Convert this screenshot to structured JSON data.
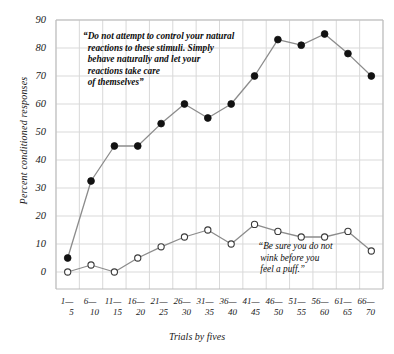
{
  "chart_data": {
    "type": "line",
    "title": "",
    "xlabel": "Trials by fives",
    "ylabel": "Percent conditioned responses",
    "ylim": [
      0,
      90
    ],
    "ytick_step": 10,
    "grid": true,
    "legend_position": "none",
    "categories": [
      "1—\n5",
      "6—\n10",
      "11—\n15",
      "16—\n20",
      "21—\n25",
      "26—\n30",
      "31—\n35",
      "36—\n40",
      "41—\n45",
      "46—\n50",
      "51—\n55",
      "56—\n60",
      "61—\n65",
      "66—\n70"
    ],
    "xtick_tops": [
      "1—",
      "6—",
      "11—",
      "16—",
      "21—",
      "26—",
      "31—",
      "36—",
      "41—",
      "46—",
      "51—",
      "56—",
      "61—",
      "66—"
    ],
    "xtick_bottoms": [
      "5",
      "10",
      "15",
      "20",
      "25",
      "30",
      "35",
      "40",
      "45",
      "50",
      "55",
      "60",
      "65",
      "70"
    ],
    "ytick_labels": [
      "0",
      "10",
      "20",
      "30",
      "40",
      "50",
      "60",
      "70",
      "80",
      "90"
    ],
    "series": [
      {
        "name": "Instructed to behave naturally",
        "marker": "filled-circle",
        "color": "#111111",
        "values": [
          5,
          32.5,
          45,
          45,
          53,
          60,
          55,
          60,
          70,
          83,
          81,
          85,
          78,
          70
        ]
      },
      {
        "name": "Instructed not to wink",
        "marker": "open-circle",
        "color": "#111111",
        "values": [
          0,
          2.5,
          0,
          5,
          9,
          12.5,
          15,
          10,
          17,
          14.5,
          12.5,
          12.5,
          14.5,
          7.5
        ]
      }
    ],
    "annotations": [
      {
        "id": "annotation-natural-reactions",
        "text": "“Do not attempt to control your natural\n  reactions to these stimuli. Simply\n  behave naturally and let your\n  reactions take care\n  of themselves”",
        "x": 83,
        "y": 33
      },
      {
        "id": "annotation-do-not-wink",
        "text": "“Be sure you do not\n wink before you\n feel a puff.”",
        "x": 258,
        "y": 243
      }
    ],
    "colors": {
      "grid": "#d9d9d9",
      "axis": "#bbbbbb",
      "line": "#8c8c8c",
      "marker_fill": "#121212",
      "marker_open_fill": "#ffffff",
      "background": "#ffffff",
      "text": "#1a1a1a"
    }
  }
}
